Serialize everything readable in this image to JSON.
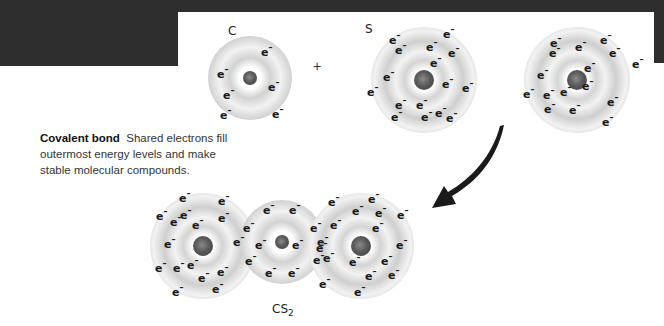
{
  "header": {
    "text": ""
  },
  "caption": {
    "title": "Covalent bond",
    "body": "Shared electrons fill outermost energy levels and make stable molecular compounds."
  },
  "reactants": [
    {
      "symbol": "C",
      "cx": 250,
      "cy": 78,
      "r": 42,
      "nucleus_r": 7,
      "rings": 2,
      "electrons": [
        [
          221,
          72
        ],
        [
          265,
          50
        ],
        [
          227,
          93
        ],
        [
          272,
          85
        ],
        [
          224,
          113
        ],
        [
          276,
          112
        ]
      ]
    },
    {
      "symbol": "S",
      "cx": 424,
      "cy": 80,
      "r": 53,
      "nucleus_r": 10,
      "rings": 3,
      "electrons": [
        [
          393,
          38
        ],
        [
          430,
          45
        ],
        [
          447,
          32
        ],
        [
          399,
          48
        ],
        [
          434,
          61
        ],
        [
          452,
          51
        ],
        [
          387,
          75
        ],
        [
          371,
          90
        ],
        [
          399,
          103
        ],
        [
          420,
          103
        ],
        [
          446,
          82
        ],
        [
          466,
          86
        ],
        [
          439,
          111
        ],
        [
          395,
          115
        ],
        [
          425,
          115
        ],
        [
          450,
          116
        ]
      ]
    },
    {
      "symbol": "",
      "cx": 577,
      "cy": 80,
      "r": 53,
      "nucleus_r": 10,
      "rings": 3,
      "electrons": [
        [
          554,
          41
        ],
        [
          579,
          45
        ],
        [
          604,
          38
        ],
        [
          553,
          51
        ],
        [
          613,
          51
        ],
        [
          588,
          66
        ],
        [
          541,
          73
        ],
        [
          586,
          84
        ],
        [
          636,
          62
        ],
        [
          527,
          92
        ],
        [
          547,
          93
        ],
        [
          564,
          90
        ],
        [
          611,
          100
        ],
        [
          548,
          107
        ],
        [
          573,
          108
        ],
        [
          606,
          120
        ]
      ]
    }
  ],
  "plus_sign": "+",
  "arrow": {
    "direction": "curved-down-left",
    "color": "#1a1a1a"
  },
  "product": {
    "label": "CS",
    "subscript": "2",
    "atoms": [
      {
        "element": "S",
        "cx": 203,
        "cy": 246,
        "r": 53,
        "nucleus_r": 10,
        "rings": 3
      },
      {
        "element": "C",
        "cx": 282,
        "cy": 242,
        "r": 42,
        "nucleus_r": 7,
        "rings": 2
      },
      {
        "element": "S",
        "cx": 361,
        "cy": 246,
        "r": 53,
        "nucleus_r": 10,
        "rings": 3
      }
    ],
    "electrons": [
      [
        183,
        196
      ],
      [
        222,
        199
      ],
      [
        160,
        214
      ],
      [
        174,
        220
      ],
      [
        184,
        213
      ],
      [
        196,
        223
      ],
      [
        222,
        216
      ],
      [
        168,
        242
      ],
      [
        159,
        266
      ],
      [
        177,
        266
      ],
      [
        191,
        263
      ],
      [
        202,
        276
      ],
      [
        221,
        270
      ],
      [
        176,
        290
      ],
      [
        216,
        287
      ],
      [
        237,
        240
      ],
      [
        247,
        226
      ],
      [
        249,
        259
      ],
      [
        267,
        208
      ],
      [
        293,
        208
      ],
      [
        259,
        243
      ],
      [
        296,
        243
      ],
      [
        269,
        271
      ],
      [
        292,
        271
      ],
      [
        314,
        226
      ],
      [
        317,
        258
      ],
      [
        320,
        246
      ],
      [
        332,
        200
      ],
      [
        356,
        209
      ],
      [
        372,
        197
      ],
      [
        379,
        211
      ],
      [
        401,
        213
      ],
      [
        376,
        226
      ],
      [
        334,
        223
      ],
      [
        321,
        240
      ],
      [
        400,
        243
      ],
      [
        327,
        256
      ],
      [
        353,
        260
      ],
      [
        385,
        259
      ],
      [
        369,
        274
      ],
      [
        392,
        273
      ],
      [
        323,
        282
      ],
      [
        358,
        290
      ]
    ]
  }
}
